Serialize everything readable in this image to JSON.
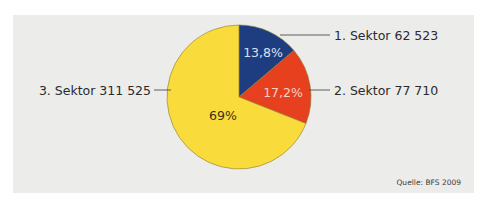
{
  "chart_data": {
    "type": "pie",
    "title": "",
    "source": "Quelle: BFS 2009",
    "start_angle": "12 o'clock",
    "direction": "clockwise",
    "slices": [
      {
        "name": "1. Sektor",
        "value": 62523,
        "value_label": "62 523",
        "percent": 13.8,
        "percent_label": "13,8%",
        "color": "#1d3d80",
        "text_color": "#d9e0f0",
        "label_side": "right"
      },
      {
        "name": "2. Sektor",
        "value": 77710,
        "value_label": "77 710",
        "percent": 17.2,
        "percent_label": "17,2%",
        "color": "#e6401e",
        "text_color": "#f6d2c8",
        "label_side": "right"
      },
      {
        "name": "3. Sektor",
        "value": 311525,
        "value_label": "311 525",
        "percent": 69.0,
        "percent_label": "69%",
        "color": "#f9dc3c",
        "text_color": "#3a3218",
        "label_side": "left"
      }
    ],
    "legend": "none"
  },
  "background_color": "#ececeb",
  "outline_color": "#8a7a30"
}
